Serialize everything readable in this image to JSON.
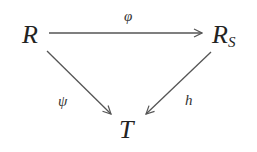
{
  "diagram": {
    "type": "commutative-triangle",
    "nodes": {
      "R": {
        "label": "R"
      },
      "RS": {
        "label": "R",
        "subscript": "S"
      },
      "T": {
        "label": "T"
      }
    },
    "arrows": [
      {
        "from": "R",
        "to": "RS",
        "label": "φ"
      },
      {
        "from": "R",
        "to": "T",
        "label": "ψ"
      },
      {
        "from": "RS",
        "to": "T",
        "label": "h"
      }
    ]
  }
}
